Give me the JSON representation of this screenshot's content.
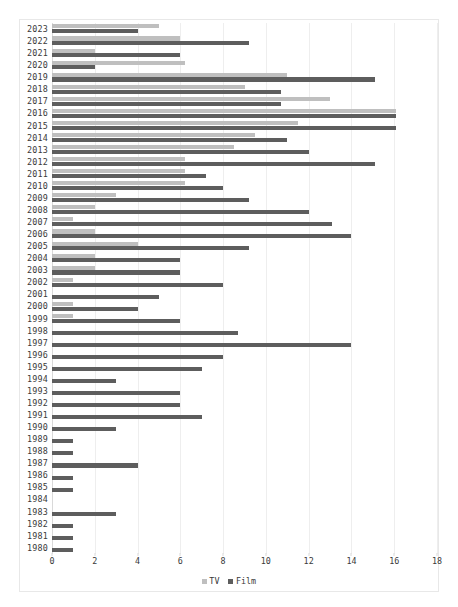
{
  "chart_data": {
    "type": "bar",
    "orientation": "horizontal",
    "title": "",
    "subtitle": "",
    "xlabel": "",
    "ylabel": "",
    "xlim": [
      0,
      18
    ],
    "ylim": null,
    "grid": true,
    "gridlines_axis": "x",
    "legend_position": "bottom-center",
    "xticks": [
      0,
      2,
      4,
      6,
      8,
      10,
      12,
      14,
      16,
      18
    ],
    "xtick_labels": [
      "0",
      "2",
      "4",
      "6",
      "8",
      "10",
      "12",
      "14",
      "16",
      "18"
    ],
    "categories": [
      "2023",
      "2022",
      "2021",
      "2020",
      "2019",
      "2018",
      "2017",
      "2016",
      "2015",
      "2014",
      "2013",
      "2012",
      "2011",
      "2010",
      "2009",
      "2008",
      "2007",
      "2006",
      "2005",
      "2004",
      "2003",
      "2002",
      "2001",
      "2000",
      "1999",
      "1998",
      "1997",
      "1996",
      "1995",
      "1994",
      "1993",
      "1992",
      "1991",
      "1990",
      "1989",
      "1988",
      "1987",
      "1986",
      "1985",
      "1984",
      "1983",
      "1982",
      "1981",
      "1980"
    ],
    "series": [
      {
        "name": "TV",
        "color": "#bfbfbf",
        "values": [
          5.0,
          6.0,
          2.0,
          6.2,
          11.0,
          9.0,
          13.0,
          16.1,
          11.5,
          9.5,
          8.5,
          6.2,
          6.2,
          6.2,
          3.0,
          2.0,
          1.0,
          2.0,
          4.0,
          2.0,
          2.0,
          1.0,
          0.0,
          1.0,
          1.0,
          0.0,
          0.0,
          0.0,
          0.0,
          0.0,
          0.0,
          0.0,
          0.0,
          0.0,
          0.0,
          0.0,
          0.0,
          0.0,
          0.0,
          0.0,
          0.0,
          0.0,
          0.0,
          0.0
        ]
      },
      {
        "name": "Film",
        "color": "#5d5d5d",
        "values": [
          4.0,
          9.2,
          6.0,
          2.0,
          15.1,
          10.7,
          10.7,
          16.1,
          16.1,
          11.0,
          12.0,
          15.1,
          7.2,
          8.0,
          9.2,
          12.0,
          13.1,
          14.0,
          9.2,
          6.0,
          6.0,
          8.0,
          5.0,
          4.0,
          6.0,
          8.7,
          14.0,
          8.0,
          7.0,
          3.0,
          6.0,
          6.0,
          7.0,
          3.0,
          1.0,
          1.0,
          4.0,
          1.0,
          1.0,
          0.0,
          3.0,
          1.0,
          1.0,
          1.0
        ]
      }
    ],
    "legend": [
      {
        "label": "TV",
        "color": "#bfbfbf",
        "marker": "square-swatch-icon"
      },
      {
        "label": "Film",
        "color": "#5d5d5d",
        "marker": "square-swatch-icon"
      }
    ]
  }
}
